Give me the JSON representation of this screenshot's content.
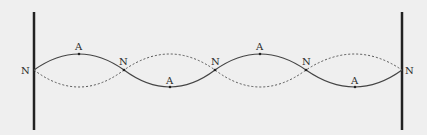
{
  "diagram": {
    "node_label": "N",
    "antinode_label": "A",
    "nodes": [
      {
        "label": "N",
        "x": 34,
        "y": 70
      },
      {
        "label": "N",
        "x": 124,
        "y": 70
      },
      {
        "label": "N",
        "x": 215,
        "y": 70
      },
      {
        "label": "N",
        "x": 306,
        "y": 70
      },
      {
        "label": "N",
        "x": 402,
        "y": 70
      }
    ],
    "antinodes": [
      {
        "label": "A",
        "x": 79,
        "y": 54
      },
      {
        "label": "A",
        "x": 170,
        "y": 88
      },
      {
        "label": "A",
        "x": 260,
        "y": 54
      },
      {
        "label": "A",
        "x": 355,
        "y": 88
      }
    ],
    "colors": {
      "line": "#444444",
      "wall": "#222222",
      "background": "#efefef"
    }
  }
}
